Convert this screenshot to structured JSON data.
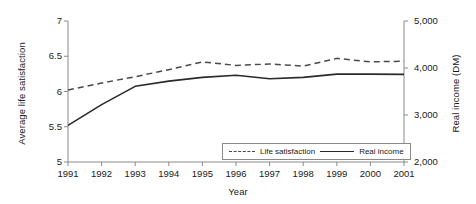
{
  "chart_data": {
    "type": "line",
    "title": "",
    "xlabel": "Year",
    "ylabel": "Average life satisfaction",
    "ylabel_right": "Real income (DM)",
    "categories": [
      "1991",
      "1992",
      "1993",
      "1994",
      "1995",
      "1996",
      "1997",
      "1998",
      "1999",
      "2000",
      "2001"
    ],
    "x": [
      1991,
      1992,
      1993,
      1994,
      1995,
      1996,
      1997,
      1998,
      1999,
      2000,
      2001
    ],
    "ylim": [
      5,
      7
    ],
    "ylim_right": [
      2000,
      5000
    ],
    "yticks": [
      "5",
      "5.5",
      "6",
      "6.5",
      "7"
    ],
    "ytick_values": [
      5,
      5.5,
      6,
      6.5,
      7
    ],
    "yticks_right": [
      "2,000",
      "3,000",
      "4,000",
      "5,000"
    ],
    "ytick_values_right": [
      2000,
      3000,
      4000,
      5000
    ],
    "grid": false,
    "legend_position": "inside-bottom-right",
    "series": [
      {
        "name": "Life satisfaction",
        "axis": "left",
        "style": "dashed",
        "color": "#4a4a4a",
        "values": [
          6.02,
          6.12,
          6.21,
          6.31,
          6.42,
          6.37,
          6.39,
          6.36,
          6.47,
          6.42,
          6.43
        ]
      },
      {
        "name": "Real income",
        "axis": "right",
        "style": "solid",
        "color": "#2a2a2a",
        "values": [
          2780,
          3220,
          3610,
          3720,
          3800,
          3845,
          3770,
          3800,
          3870,
          3870,
          3865
        ]
      }
    ]
  },
  "legend": {
    "items": [
      {
        "label": "Life satisfaction",
        "style": "dashed"
      },
      {
        "label": "Real income",
        "style": "solid"
      }
    ]
  }
}
